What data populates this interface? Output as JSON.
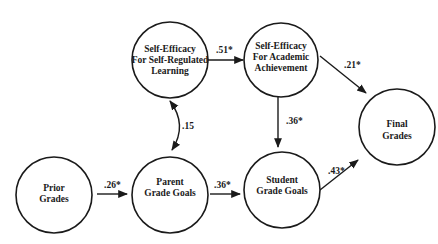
{
  "diagram": {
    "type": "path-model",
    "nodes": [
      {
        "id": "sesrl",
        "lines": [
          "Self-Efficacy",
          "For Self-Regulated",
          "Learning"
        ]
      },
      {
        "id": "seaa",
        "lines": [
          "Self-Efficacy",
          "For Academic",
          "Achievement"
        ]
      },
      {
        "id": "final",
        "lines": [
          "Final",
          "Grades"
        ]
      },
      {
        "id": "prior",
        "lines": [
          "Prior",
          "Grades"
        ]
      },
      {
        "id": "parent",
        "lines": [
          "Parent",
          "Grade Goals"
        ]
      },
      {
        "id": "student",
        "lines": [
          "Student",
          "Grade Goals"
        ]
      }
    ],
    "edges": [
      {
        "from": "prior",
        "to": "parent",
        "label": ".26*"
      },
      {
        "from": "parent",
        "to": "student",
        "label": ".36*"
      },
      {
        "from": "student",
        "to": "final",
        "label": ".43*"
      },
      {
        "from": "sesrl",
        "to": "seaa",
        "label": ".51*"
      },
      {
        "from": "seaa",
        "to": "final",
        "label": ".21*"
      },
      {
        "from": "seaa",
        "to": "student",
        "label": ".36*"
      },
      {
        "from": "parent",
        "to": "sesrl",
        "label": ".15",
        "bidirectional": true
      }
    ],
    "note": "* denotes significant path coefficient"
  }
}
